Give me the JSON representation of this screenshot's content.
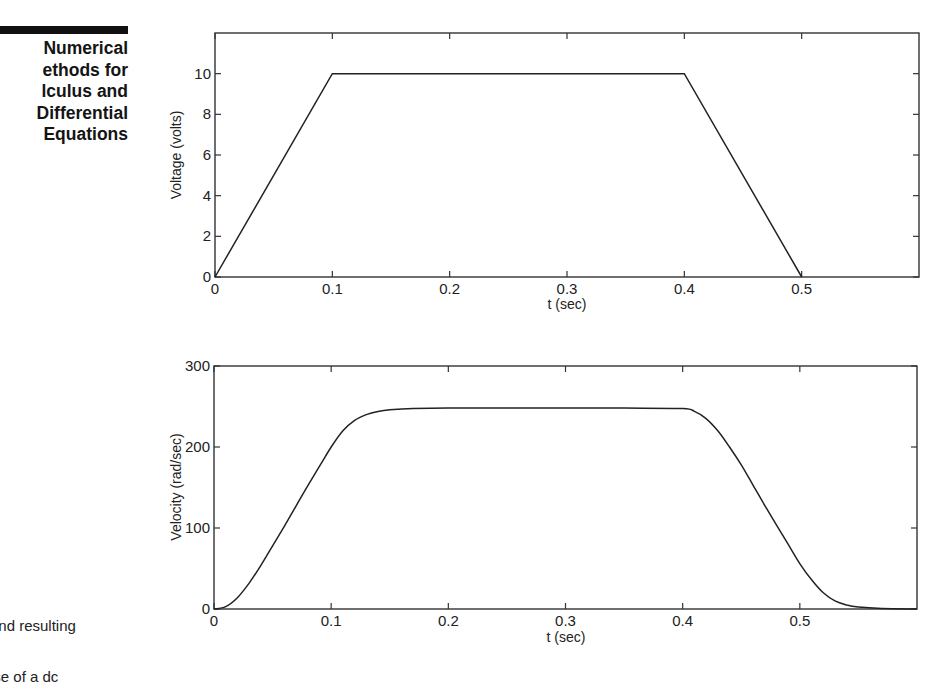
{
  "sidebar": {
    "title_lines": [
      "Numerical",
      "ethods for",
      "lculus and",
      "Differential",
      "Equations"
    ]
  },
  "caption": {
    "lines": [
      "s",
      "and resulting",
      "ise of a dc"
    ]
  },
  "chart_data": [
    {
      "type": "line",
      "title": "",
      "xlabel": "t (sec)",
      "ylabel": "Voltage (volts)",
      "xlim": [
        0,
        0.6
      ],
      "ylim": [
        0,
        12
      ],
      "xticks": [
        0,
        0.1,
        0.2,
        0.3,
        0.4,
        0.5
      ],
      "xtick_labels": [
        "0",
        "0.1",
        "0.2",
        "0.3",
        "0.4",
        "0.5"
      ],
      "yticks": [
        0,
        2,
        4,
        6,
        8,
        10
      ],
      "ytick_labels": [
        "0",
        "2",
        "4",
        "6",
        "8",
        "10"
      ],
      "grid": false,
      "legend": null,
      "series": [
        {
          "name": "Voltage",
          "x": [
            0,
            0.1,
            0.4,
            0.5
          ],
          "y": [
            0,
            10,
            10,
            0
          ]
        }
      ]
    },
    {
      "type": "line",
      "title": "",
      "xlabel": "t (sec)",
      "ylabel": "Velocity (rad/sec)",
      "xlim": [
        0,
        0.6
      ],
      "ylim": [
        0,
        300
      ],
      "xticks": [
        0,
        0.1,
        0.2,
        0.3,
        0.4,
        0.5
      ],
      "xtick_labels": [
        "0",
        "0.1",
        "0.2",
        "0.3",
        "0.4",
        "0.5"
      ],
      "yticks": [
        0,
        100,
        200,
        300
      ],
      "ytick_labels": [
        "0",
        "100",
        "200",
        "300"
      ],
      "grid": false,
      "legend": null,
      "series": [
        {
          "name": "Velocity",
          "x": [
            0,
            0.01,
            0.02,
            0.03,
            0.04,
            0.05,
            0.06,
            0.07,
            0.08,
            0.09,
            0.1,
            0.11,
            0.12,
            0.13,
            0.14,
            0.15,
            0.17,
            0.2,
            0.25,
            0.3,
            0.35,
            0.4,
            0.41,
            0.42,
            0.43,
            0.44,
            0.45,
            0.46,
            0.47,
            0.48,
            0.49,
            0.5,
            0.51,
            0.52,
            0.53,
            0.54,
            0.55,
            0.57,
            0.6
          ],
          "y": [
            0,
            3,
            14,
            32,
            54,
            78,
            102,
            127,
            152,
            176,
            200,
            220,
            233,
            240,
            244,
            246,
            247.5,
            248,
            248,
            248,
            248,
            247.5,
            244,
            235,
            220,
            200,
            178,
            153,
            128,
            104,
            80,
            56,
            36,
            20,
            10,
            5,
            2.5,
            0.8,
            0
          ]
        }
      ]
    }
  ]
}
